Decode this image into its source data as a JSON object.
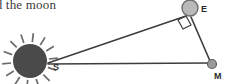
{
  "figure": {
    "caption": "nd the moon",
    "background_color": "#ffffff",
    "width": 228,
    "height": 84
  },
  "colors": {
    "sun_fill": "#4a4a4a",
    "sun_ray": "#6b6b6b",
    "earth_fill": "#b9b9b9",
    "earth_stroke": "#6e6e6e",
    "moon_fill": "#9a9a9a",
    "moon_stroke": "#5f5f5f",
    "line": "#3d3d3d",
    "label": "#2b2b2b",
    "text": "#3a3a3a"
  },
  "bodies": [
    {
      "name": "sun",
      "label": "S",
      "label_x": 53,
      "label_y": 70,
      "cx": 30,
      "cy": 61,
      "r": 17,
      "rays": 14,
      "ray_inner": 19,
      "ray_outer": 28
    },
    {
      "name": "earth",
      "label": "E",
      "label_x": 201,
      "label_y": 12,
      "cx": 190,
      "cy": 8,
      "r": 8
    },
    {
      "name": "moon",
      "label": "M",
      "label_x": 214,
      "label_y": 79,
      "cx": 212,
      "cy": 64,
      "r": 4.5
    }
  ],
  "segments": [
    {
      "name": "sun-to-earth",
      "x1": 48,
      "y1": 63,
      "x2": 186,
      "y2": 16
    },
    {
      "name": "sun-to-moon",
      "x1": 48,
      "y1": 64,
      "x2": 209,
      "y2": 63
    },
    {
      "name": "earth-to-moon",
      "x1": 191,
      "y1": 17,
      "x2": 210,
      "y2": 61
    }
  ],
  "right_angle_marker": {
    "name": "right-angle-at-earth",
    "points": "178,20 186,16 191,25 183,29"
  }
}
